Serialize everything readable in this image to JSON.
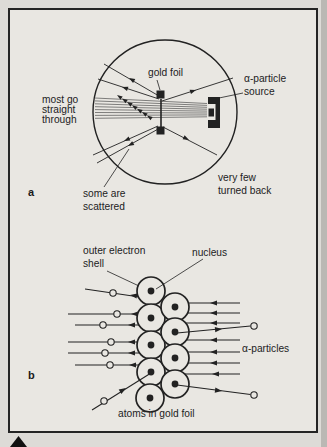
{
  "figure": {
    "panel_a": {
      "tag": "a",
      "gold_foil": "gold foil",
      "source_l1": "α-particle",
      "source_l2": "source",
      "most_l1": "most go",
      "most_l2": "straight",
      "most_l3": "through",
      "some_l1": "some are",
      "some_l2": "scattered",
      "few_l1": "very few",
      "few_l2": "turned back"
    },
    "panel_b": {
      "tag": "b",
      "shell_l1": "outer electron",
      "shell_l2": "shell",
      "nucleus": "nucleus",
      "alpha_particles": "α-particles",
      "atoms_caption": "atoms in gold foil"
    }
  },
  "diagram": {
    "ink": "#222222",
    "paper": "#e9e7e2",
    "page_bg": "#dddbd7",
    "beam_color": "#4d4d4d",
    "frame": {
      "x": 9,
      "y": 9,
      "w": 308,
      "h": 423
    },
    "edge_strip": {
      "x": 321,
      "w": 6,
      "color": "#bab8b4"
    },
    "panel_a": {
      "circle": {
        "cx": 165,
        "cy": 112,
        "r": 72
      },
      "beam_lines": [
        [
          207,
          103.5,
          95,
          98.0
        ],
        [
          207,
          105.4,
          95,
          100.9
        ],
        [
          207,
          107.3,
          95,
          103.8
        ],
        [
          207,
          109.2,
          95,
          106.7
        ],
        [
          207,
          111.1,
          95,
          109.6
        ],
        [
          207,
          113.0,
          95,
          112.5
        ],
        [
          207,
          114.9,
          95,
          115.4
        ],
        [
          207,
          116.8,
          95,
          118.3
        ]
      ],
      "foil": {
        "line": [
          161,
          99,
          161,
          128
        ],
        "squares": [
          [
            156.5,
            90.5,
            8,
            8
          ],
          [
            156.5,
            126.5,
            8,
            8
          ]
        ]
      },
      "source_rects": [
        [
          208,
          97,
          12,
          31,
          "ink"
        ],
        [
          208,
          104,
          7.5,
          16,
          "paper"
        ],
        [
          208.5,
          108.5,
          5.5,
          8,
          "ink"
        ]
      ],
      "rays": [
        {
          "line": [
            159,
            96,
            104,
            64
          ],
          "arrow": [
            129,
            78,
            210
          ]
        },
        {
          "line": [
            159,
            99,
            98,
            79
          ],
          "arrow": [
            122,
            87,
            198
          ]
        },
        {
          "line": [
            158,
            126,
            93,
            155
          ],
          "arrow": [
            124,
            141,
            156
          ]
        },
        {
          "line": [
            160,
            128,
            97,
            163
          ],
          "arrow": [
            128,
            146,
            151
          ]
        },
        {
          "line": [
            162,
            101,
            233,
            78
          ],
          "arrow": [
            196,
            90,
            -18
          ]
        },
        {
          "line": [
            163,
            127,
            217,
            155
          ],
          "arrow": [
            189,
            140,
            27
          ]
        }
      ],
      "small_arrows": [
        [
          147,
          115.5,
          214
        ],
        [
          142,
          112.1,
          214
        ],
        [
          137,
          108.7,
          214
        ],
        [
          132,
          105.3,
          214
        ],
        [
          127,
          101.9,
          214
        ],
        [
          122,
          98.5,
          214
        ],
        [
          117,
          95.1,
          214
        ]
      ],
      "pointers": [
        [
          157,
          80,
          160,
          90
        ],
        [
          243,
          93,
          219,
          98
        ],
        [
          104,
          187,
          129,
          149
        ]
      ]
    },
    "panel_b": {
      "atom_r": 14,
      "nucleus_r": 3.4,
      "atoms": [
        [
          151,
          291
        ],
        [
          151,
          318
        ],
        [
          151,
          345
        ],
        [
          151,
          372
        ],
        [
          150,
          398
        ],
        [
          175,
          307
        ],
        [
          175,
          332
        ],
        [
          175,
          358
        ],
        [
          175,
          384
        ]
      ],
      "tracks_under": [
        {
          "line": [
            85,
            289,
            160,
            300
          ],
          "arrow": [
            130,
            295,
            188
          ],
          "circle": [
            113,
            293
          ]
        },
        {
          "line": [
            68,
            314,
            163,
            314
          ],
          "arrow": [
            131,
            314,
            180
          ],
          "circle": [
            117,
            314
          ]
        },
        {
          "line": [
            75,
            325,
            162,
            325
          ],
          "arrow": [
            128,
            325,
            180
          ],
          "circle": [
            103,
            325
          ]
        },
        {
          "line": [
            68,
            342,
            163,
            342
          ],
          "arrow": [
            128,
            342,
            180
          ],
          "circle": [
            111,
            342
          ]
        },
        {
          "line": [
            68,
            353,
            163,
            353
          ],
          "arrow": [
            128,
            353,
            180
          ],
          "circle": [
            105,
            353
          ]
        },
        {
          "line": [
            75,
            365,
            162,
            365
          ],
          "arrow": [
            129,
            365,
            180
          ],
          "circle": [
            110,
            365
          ]
        },
        {
          "line": [
            163,
            303,
            240,
            303
          ],
          "arrow": [
            210,
            303,
            180
          ],
          "circle": null
        },
        {
          "line": [
            165,
            313,
            240,
            313
          ],
          "arrow": [
            210,
            313,
            180
          ],
          "circle": null
        },
        {
          "line": [
            168,
            323,
            240,
            323
          ],
          "arrow": [
            210,
            323,
            180
          ],
          "circle": null
        },
        {
          "line": [
            165,
            340,
            240,
            340
          ],
          "arrow": [
            210,
            340,
            180
          ],
          "circle": null
        },
        {
          "line": [
            168,
            352,
            240,
            352
          ],
          "arrow": [
            210,
            352,
            180
          ],
          "circle": null
        },
        {
          "line": [
            168,
            363,
            240,
            363
          ],
          "arrow": [
            210,
            363,
            180
          ],
          "circle": null
        },
        {
          "line": [
            180,
            374,
            240,
            374
          ],
          "arrow": [
            212,
            374,
            180
          ],
          "circle": null
        }
      ],
      "tracks_over": [
        {
          "line": [
            92,
            410,
            151,
            373
          ],
          "arrow": [
            126,
            388,
            -32
          ],
          "circle": [
            104,
            401
          ]
        },
        {
          "line": [
            177,
            333,
            250.5,
            326
          ],
          "arrow": [
            222,
            329,
            -5.5
          ],
          "circle": [
            254,
            326
          ]
        },
        {
          "line": [
            177,
            385,
            250.5,
            394.5
          ],
          "arrow": [
            222,
            391,
            7.4
          ],
          "circle": [
            254,
            395
          ]
        }
      ],
      "pointers": [
        [
          107,
          271,
          139,
          286
        ],
        [
          203,
          259,
          156,
          289
        ]
      ]
    },
    "marker_triangle": [
      [
        10,
        447
      ],
      [
        27,
        447
      ],
      [
        18.5,
        436
      ]
    ]
  }
}
